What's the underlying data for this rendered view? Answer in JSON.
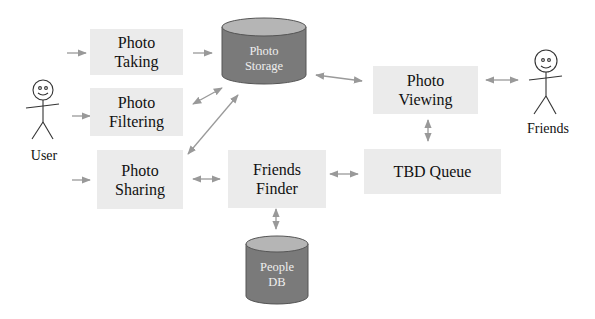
{
  "diagram": {
    "actors": {
      "user": {
        "label": "User"
      },
      "friends": {
        "label": "Friends"
      }
    },
    "processes": {
      "photo_taking": {
        "label": "Photo\nTaking"
      },
      "photo_filtering": {
        "label": "Photo\nFiltering"
      },
      "photo_sharing": {
        "label": "Photo\nSharing"
      },
      "friends_finder": {
        "label": "Friends\nFinder"
      },
      "photo_viewing": {
        "label": "Photo\nViewing"
      },
      "tbd_queue": {
        "label": "TBD Queue"
      }
    },
    "stores": {
      "photo_storage": {
        "label": "Photo\nStorage"
      },
      "people_db": {
        "label": "People\nDB"
      }
    },
    "edges": [
      {
        "from": "User",
        "to": "Photo Taking",
        "type": "one-way"
      },
      {
        "from": "User",
        "to": "Photo Filtering",
        "type": "one-way"
      },
      {
        "from": "User",
        "to": "Photo Sharing",
        "type": "one-way"
      },
      {
        "from": "Photo Taking",
        "to": "Photo Storage",
        "type": "one-way"
      },
      {
        "from": "Photo Filtering",
        "to": "Photo Storage",
        "type": "two-way"
      },
      {
        "from": "Photo Sharing",
        "to": "Photo Storage",
        "type": "two-way"
      },
      {
        "from": "Photo Sharing",
        "to": "Friends Finder",
        "type": "two-way"
      },
      {
        "from": "Photo Storage",
        "to": "Photo Viewing",
        "type": "two-way"
      },
      {
        "from": "Photo Viewing",
        "to": "Friends",
        "type": "two-way"
      },
      {
        "from": "Photo Viewing",
        "to": "TBD Queue",
        "type": "two-way"
      },
      {
        "from": "Friends Finder",
        "to": "TBD Queue",
        "type": "two-way"
      },
      {
        "from": "Friends Finder",
        "to": "People DB",
        "type": "two-way"
      }
    ],
    "colors": {
      "box_fill": "#ebebeb",
      "cylinder_fill": "#7a7a7a",
      "cylinder_top": "#b5b5b5",
      "arrow": "#999999"
    }
  }
}
